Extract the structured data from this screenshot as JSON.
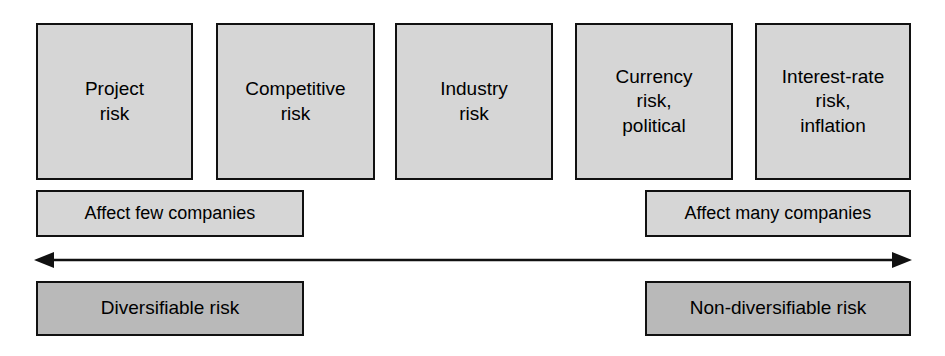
{
  "diagram": {
    "colors": {
      "box_fill_light": "#d6d6d6",
      "box_fill_dark": "#b9b9b9",
      "border": "#111111",
      "text": "#000000",
      "background": "#ffffff"
    },
    "risk_boxes": [
      {
        "label": "Project\nrisk"
      },
      {
        "label": "Competitive\nrisk"
      },
      {
        "label": "Industry\nrisk"
      },
      {
        "label": "Currency\nrisk,\npolitical"
      },
      {
        "label": "Interest-rate\nrisk,\ninflation"
      }
    ],
    "scope_labels": {
      "few": "Affect few companies",
      "many": "Affect many companies"
    },
    "arrow": {
      "name": "double-headed-arrow",
      "left_head": "◀",
      "right_head": "▶"
    },
    "summary_labels": {
      "left": "Diversifiable risk",
      "right": "Non-diversifiable risk"
    }
  }
}
